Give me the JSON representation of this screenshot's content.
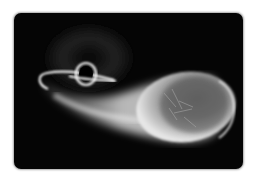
{
  "image": {
    "subject": "Illustration of a black hole tidally disrupting a star",
    "elements": [
      "black-hole",
      "accretion-ring",
      "tidal-stream",
      "disrupted-star"
    ],
    "colors": {
      "background": "#ffffff",
      "frame": "#050505",
      "star_light": "#e8e8e8",
      "star_shadow": "#5a5a5a",
      "ring": "#f4f4f4",
      "haze": "#3a3a3a"
    }
  }
}
